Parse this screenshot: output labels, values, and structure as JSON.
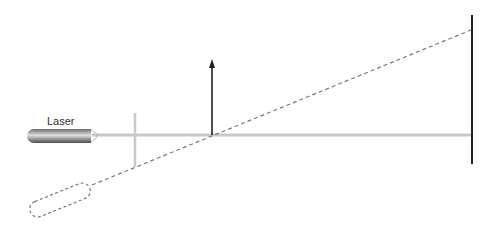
{
  "diagram": {
    "labels": {
      "laser": "Laser"
    },
    "colors": {
      "beam": "#c8c8c8",
      "screen": "#222222",
      "arrow": "#222222",
      "dashed": "#777777",
      "laser_dark": "#555555",
      "laser_light": "#d8d8d8"
    },
    "elements": [
      {
        "id": "laser",
        "type": "laser-source",
        "label": "Laser"
      },
      {
        "id": "beam",
        "type": "horizontal-beam"
      },
      {
        "id": "aperture",
        "type": "vertical-slit-line"
      },
      {
        "id": "normal-arrow",
        "type": "vertical-arrow"
      },
      {
        "id": "screen",
        "type": "vertical-screen"
      },
      {
        "id": "tilted-path",
        "type": "dashed-line"
      },
      {
        "id": "tilted-laser",
        "type": "dashed-laser-outline"
      }
    ]
  }
}
